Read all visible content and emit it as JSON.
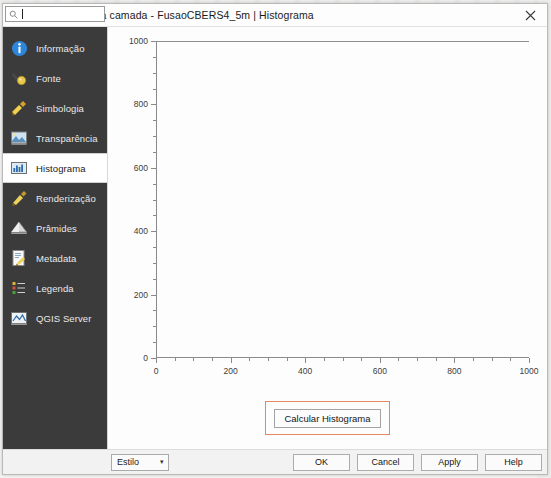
{
  "window": {
    "title": "Propriedades da camada - FusaoCBERS4_5m | Histograma",
    "logo_icon": "qgis-q-icon",
    "close_icon": "close-icon"
  },
  "search": {
    "value": "",
    "placeholder": "",
    "icon": "search-icon"
  },
  "sidebar": {
    "items": [
      {
        "label": "Informação",
        "icon": "info-icon",
        "selected": false
      },
      {
        "label": "Fonte",
        "icon": "source-icon",
        "selected": false
      },
      {
        "label": "Simbologia",
        "icon": "symbology-icon",
        "selected": false
      },
      {
        "label": "Transparência",
        "icon": "transparency-icon",
        "selected": false
      },
      {
        "label": "Histograma",
        "icon": "histogram-icon",
        "selected": true
      },
      {
        "label": "Renderização",
        "icon": "rendering-icon",
        "selected": false
      },
      {
        "label": "Prâmides",
        "icon": "pyramids-icon",
        "selected": false
      },
      {
        "label": "Metadata",
        "icon": "metadata-icon",
        "selected": false
      },
      {
        "label": "Legenda",
        "icon": "legend-icon",
        "selected": false
      },
      {
        "label": "QGIS Server",
        "icon": "qgis-server-icon",
        "selected": false
      }
    ]
  },
  "chart_data": {
    "type": "line",
    "title": "",
    "xlabel": "",
    "ylabel": "",
    "xlim": [
      0,
      1000
    ],
    "ylim": [
      0,
      1000
    ],
    "xticks": [
      0,
      200,
      400,
      600,
      800,
      1000
    ],
    "yticks": [
      0,
      200,
      400,
      600,
      800,
      1000
    ],
    "xtick_labels": [
      "0",
      "200",
      "400",
      "600",
      "800",
      "1000"
    ],
    "ytick_labels": [
      "0",
      "200",
      "400",
      "600",
      "800",
      "1000"
    ],
    "grid": false,
    "legend": false,
    "series": [
      {
        "name": "",
        "x": [
          0,
          1000
        ],
        "values": [
          1000,
          1000
        ]
      }
    ]
  },
  "main": {
    "calculate_button": "Calcular Histograma"
  },
  "footer": {
    "style_label": "Estilo",
    "style_arrow": "chevron-down-icon",
    "buttons": [
      {
        "label": "OK"
      },
      {
        "label": "Cancel"
      },
      {
        "label": "Apply"
      },
      {
        "label": "Help"
      }
    ]
  },
  "colors": {
    "sidebar_bg": "#3b3b3b",
    "highlight_border": "#e08a5d",
    "axis": "#8a8a8a",
    "qgis_green": "#8cc63f"
  }
}
